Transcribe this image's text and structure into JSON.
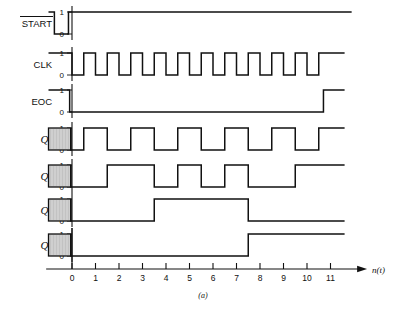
{
  "figure": {
    "caption": "(a)",
    "axis_label": "n(t)",
    "level_high": "1",
    "level_low": "0"
  },
  "axis": {
    "ticks": [
      "0",
      "1",
      "2",
      "3",
      "4",
      "5",
      "6",
      "7",
      "8",
      "9",
      "10",
      "11"
    ],
    "tick_values": [
      0,
      1,
      2,
      3,
      4,
      5,
      6,
      7,
      8,
      9,
      10,
      11
    ],
    "xmin": -1.1,
    "xmax": 12.6,
    "arrow": true
  },
  "signals": [
    {
      "name": "START",
      "label": "START",
      "overbar": true,
      "italic": false,
      "subscript": "",
      "shaded_start": false,
      "initial": 1,
      "transitions": [
        {
          "t": -0.75,
          "level": 0
        },
        {
          "t": -0.15,
          "level": 1
        }
      ],
      "end_t": 11.9
    },
    {
      "name": "CLK",
      "label": "CLK",
      "overbar": false,
      "italic": false,
      "subscript": "",
      "shaded_start": false,
      "initial": 1,
      "transitions": [
        {
          "t": 0.0,
          "level": 0
        },
        {
          "t": 0.5,
          "level": 1
        },
        {
          "t": 1.0,
          "level": 0
        },
        {
          "t": 1.5,
          "level": 1
        },
        {
          "t": 2.0,
          "level": 0
        },
        {
          "t": 2.5,
          "level": 1
        },
        {
          "t": 3.0,
          "level": 0
        },
        {
          "t": 3.5,
          "level": 1
        },
        {
          "t": 4.0,
          "level": 0
        },
        {
          "t": 4.5,
          "level": 1
        },
        {
          "t": 5.0,
          "level": 0
        },
        {
          "t": 5.5,
          "level": 1
        },
        {
          "t": 6.0,
          "level": 0
        },
        {
          "t": 6.5,
          "level": 1
        },
        {
          "t": 7.0,
          "level": 0
        },
        {
          "t": 7.5,
          "level": 1
        },
        {
          "t": 8.0,
          "level": 0
        },
        {
          "t": 8.5,
          "level": 1
        },
        {
          "t": 9.0,
          "level": 0
        },
        {
          "t": 9.5,
          "level": 1
        },
        {
          "t": 10.0,
          "level": 0
        },
        {
          "t": 10.5,
          "level": 1
        }
      ],
      "end_t": 11.6
    },
    {
      "name": "EOC",
      "label": "EOC",
      "overbar": false,
      "italic": false,
      "subscript": "",
      "shaded_start": false,
      "initial": 1,
      "transitions": [
        {
          "t": -0.1,
          "level": 0
        },
        {
          "t": 10.7,
          "level": 1
        }
      ],
      "end_t": 11.6
    },
    {
      "name": "Q0",
      "label": "Q",
      "overbar": false,
      "italic": true,
      "subscript": "0",
      "shaded_start": true,
      "initial": 1,
      "transitions": [
        {
          "t": -0.05,
          "level": 0
        },
        {
          "t": 0.5,
          "level": 1
        },
        {
          "t": 1.5,
          "level": 0
        },
        {
          "t": 2.5,
          "level": 1
        },
        {
          "t": 3.5,
          "level": 0
        },
        {
          "t": 4.5,
          "level": 1
        },
        {
          "t": 5.5,
          "level": 0
        },
        {
          "t": 6.5,
          "level": 1
        },
        {
          "t": 7.5,
          "level": 0
        },
        {
          "t": 8.5,
          "level": 1
        },
        {
          "t": 9.5,
          "level": 0
        },
        {
          "t": 10.5,
          "level": 1
        }
      ],
      "end_t": 11.6
    },
    {
      "name": "Q1",
      "label": "Q",
      "overbar": false,
      "italic": true,
      "subscript": "1",
      "shaded_start": true,
      "initial": 1,
      "transitions": [
        {
          "t": -0.05,
          "level": 0
        },
        {
          "t": 1.5,
          "level": 1
        },
        {
          "t": 3.5,
          "level": 0
        },
        {
          "t": 4.5,
          "level": 1
        },
        {
          "t": 5.5,
          "level": 0
        },
        {
          "t": 6.5,
          "level": 1
        },
        {
          "t": 7.5,
          "level": 0
        },
        {
          "t": 9.5,
          "level": 1
        }
      ],
      "end_t": 11.6
    },
    {
      "name": "Q2",
      "label": "Q",
      "overbar": false,
      "italic": true,
      "subscript": "2",
      "shaded_start": true,
      "initial": 1,
      "transitions": [
        {
          "t": -0.05,
          "level": 0
        },
        {
          "t": 3.5,
          "level": 1
        },
        {
          "t": 7.5,
          "level": 0
        }
      ],
      "end_t": 11.6
    },
    {
      "name": "Q3",
      "label": "Q",
      "overbar": false,
      "italic": true,
      "subscript": "3",
      "shaded_start": true,
      "initial": 1,
      "transitions": [
        {
          "t": -0.05,
          "level": 0
        },
        {
          "t": 7.5,
          "level": 1
        }
      ],
      "end_t": 11.6
    }
  ],
  "style": {
    "stroke": "#111111",
    "shade_fill": "#cfcfcf",
    "background": "#ffffff"
  },
  "layout": {
    "x_origin": 72,
    "x_unit": 23.5,
    "row_tops": [
      12,
      53,
      90,
      128,
      165,
      199,
      234
    ],
    "row_height": 22,
    "label_x": 52,
    "shade_left_t": -1.0,
    "shade_right_t": -0.05,
    "axis_y": 269
  }
}
